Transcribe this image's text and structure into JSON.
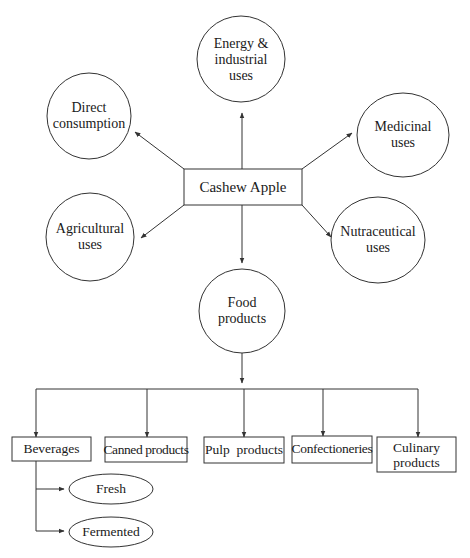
{
  "diagram": {
    "type": "flowchart",
    "center": {
      "label": "Cashew Apple"
    },
    "uses": [
      {
        "id": "energy",
        "lines": [
          "Energy &",
          "industrial",
          "uses"
        ]
      },
      {
        "id": "direct",
        "lines": [
          "Direct",
          "consumption"
        ]
      },
      {
        "id": "medicinal",
        "lines": [
          "Medicinal",
          "uses"
        ]
      },
      {
        "id": "agricultural",
        "lines": [
          "Agricultural",
          "uses"
        ]
      },
      {
        "id": "nutraceutical",
        "lines": [
          "Nutraceutical",
          "uses"
        ]
      },
      {
        "id": "food",
        "lines": [
          "Food",
          "products"
        ]
      }
    ],
    "food_products": [
      {
        "id": "beverages",
        "label": "Beverages"
      },
      {
        "id": "canned",
        "label": "Canned products"
      },
      {
        "id": "pulp",
        "label": "Pulp  products"
      },
      {
        "id": "confectioneries",
        "label": "Confectioneries"
      },
      {
        "id": "culinary",
        "lines": [
          "Culinary",
          "products"
        ]
      }
    ],
    "beverage_types": [
      {
        "id": "fresh",
        "label": "Fresh"
      },
      {
        "id": "fermented",
        "label": "Fermented"
      }
    ],
    "edges": [
      [
        "Cashew Apple",
        "Energy & industrial uses"
      ],
      [
        "Cashew Apple",
        "Direct consumption"
      ],
      [
        "Cashew Apple",
        "Medicinal uses"
      ],
      [
        "Cashew Apple",
        "Agricultural uses"
      ],
      [
        "Cashew Apple",
        "Nutraceutical uses"
      ],
      [
        "Cashew Apple",
        "Food products"
      ],
      [
        "Food products",
        "Beverages"
      ],
      [
        "Food products",
        "Canned products"
      ],
      [
        "Food products",
        "Pulp products"
      ],
      [
        "Food products",
        "Confectioneries"
      ],
      [
        "Food products",
        "Culinary products"
      ],
      [
        "Beverages",
        "Fresh"
      ],
      [
        "Beverages",
        "Fermented"
      ]
    ],
    "colors": {
      "stroke": "#333333",
      "text": "#1a1a1a",
      "background": "#ffffff"
    }
  }
}
